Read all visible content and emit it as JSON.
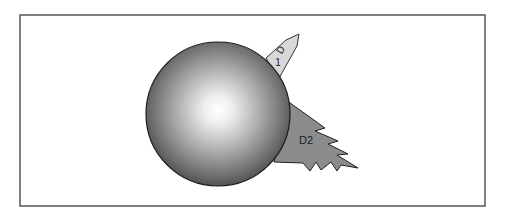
{
  "diagram": {
    "frame": {
      "stroke": "#555555",
      "fill": "#ffffff"
    },
    "sphere": {
      "label": "",
      "highlight": "#ffffff",
      "shade": "#6a6a6a",
      "edge": "#3a3a3a",
      "stroke": "#1a1a1a"
    },
    "pointer": {
      "label_letter": "D",
      "label_number": "1",
      "fill": "#d8d8d8",
      "stroke": "#333333"
    },
    "flame": {
      "label": "D2",
      "fill": "#8c8c8c",
      "stroke": "#222222"
    }
  }
}
